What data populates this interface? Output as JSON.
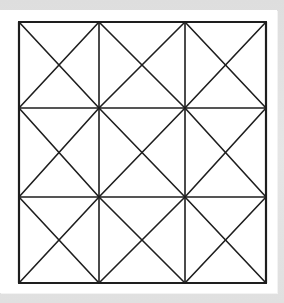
{
  "diagram": {
    "title": "",
    "colors": {
      "line": "#1e1e1e",
      "paper": "#ffffff",
      "background": "#e2e2e2"
    },
    "grid": {
      "rows": 3,
      "cols": 3,
      "x": [
        19,
        99,
        185,
        266
      ],
      "y": [
        22,
        108,
        197,
        283
      ]
    },
    "stroke_width": {
      "outline": 2.2,
      "inner": 1.6,
      "diagonal": 1.6
    }
  }
}
